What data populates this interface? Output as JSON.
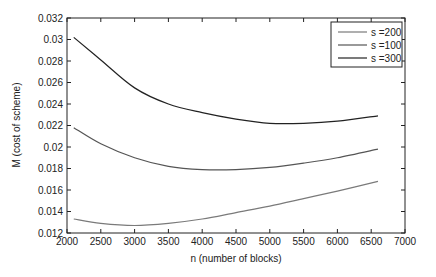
{
  "chart_data": {
    "type": "line",
    "title": "",
    "xlabel": "n  (number of blocks)",
    "ylabel": "M  (cost of scheme)",
    "xlim": [
      2000,
      7000
    ],
    "ylim": [
      0.012,
      0.032
    ],
    "xticks": [
      2000,
      2500,
      3000,
      3500,
      4000,
      4500,
      5000,
      5500,
      6000,
      6500,
      7000
    ],
    "yticks": [
      0.012,
      0.014,
      0.016,
      0.018,
      0.02,
      0.022,
      0.024,
      0.026,
      0.028,
      0.03,
      0.032
    ],
    "xtick_labels": [
      "2000",
      "2500",
      "3000",
      "3500",
      "4000",
      "4500",
      "5000",
      "5500",
      "6000",
      "6500",
      "7000"
    ],
    "ytick_labels": [
      "0.012",
      "0.014",
      "0.016",
      "0.018",
      "0.02",
      "0.022",
      "0.024",
      "0.026",
      "0.028",
      "0.03",
      "0.032"
    ],
    "grid": false,
    "legend_position": "upper right",
    "x": [
      2100,
      2500,
      3000,
      3500,
      4000,
      4500,
      5000,
      5500,
      6000,
      6600
    ],
    "series": [
      {
        "name": "s =200",
        "color": "#7a7a7a",
        "values": [
          0.0133,
          0.0129,
          0.0127,
          0.0129,
          0.0133,
          0.0139,
          0.0145,
          0.0152,
          0.0159,
          0.0168
        ]
      },
      {
        "name": "s =100",
        "color": "#555555",
        "values": [
          0.0218,
          0.0203,
          0.019,
          0.0182,
          0.0179,
          0.0179,
          0.0181,
          0.0185,
          0.019,
          0.0198
        ]
      },
      {
        "name": "s =300",
        "color": "#222222",
        "values": [
          0.0302,
          0.0281,
          0.0255,
          0.024,
          0.0232,
          0.0226,
          0.0222,
          0.0222,
          0.0224,
          0.0229
        ]
      }
    ]
  }
}
